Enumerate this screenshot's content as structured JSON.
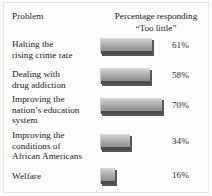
{
  "figure": {
    "background_color": "#fdfdfc",
    "bar_color_light": "#d5d3d1",
    "bar_color_dark": "#6f6d6b",
    "shadow_color": "#4e4c4a"
  },
  "header": {
    "problem_label": "Problem",
    "percentage_label_line1": "Percentage responding",
    "percentage_label_line2": "“Too little”"
  },
  "chart_data": {
    "type": "bar",
    "title": "",
    "subtitle": "",
    "xlabel": "Percentage responding “Too little”",
    "ylabel": "Problem",
    "orientation": "horizontal",
    "grid": false,
    "legend": "none",
    "xlim": [
      0,
      100
    ],
    "categories": [
      "Halting the rising crime rate",
      "Dealing with drug addiction",
      "Improving the nation’s education system",
      "Improving the conditions of African Americans",
      "Welfare"
    ],
    "values": [
      61,
      58,
      70,
      34,
      16
    ],
    "value_labels": [
      "61%",
      "58%",
      "70%",
      "34%",
      "16%"
    ]
  },
  "rows": [
    {
      "label_lines": [
        "Halting the",
        "rising crime rate"
      ],
      "value": 61,
      "value_label": "61%",
      "bar_px": 52,
      "top_px": 0,
      "label_top_px": 1,
      "height_px": 30
    },
    {
      "label_lines": [
        "Dealing with",
        "drug addiction"
      ],
      "value": 58,
      "value_label": "58%",
      "bar_px": 50,
      "top_px": 30,
      "label_top_px": 31,
      "height_px": 30
    },
    {
      "label_lines": [
        "Improving the",
        "nation’s education",
        "system"
      ],
      "value": 70,
      "value_label": "70%",
      "bar_px": 62,
      "top_px": 60,
      "label_top_px": 56,
      "height_px": 36
    },
    {
      "label_lines": [
        "Improving the",
        "conditions of",
        "African Americans"
      ],
      "value": 34,
      "value_label": "34%",
      "bar_px": 30,
      "top_px": 96,
      "label_top_px": 92,
      "height_px": 34
    },
    {
      "label_lines": [
        "Welfare"
      ],
      "value": 16,
      "value_label": "16%",
      "bar_px": 15,
      "top_px": 130,
      "label_top_px": 133,
      "height_px": 28
    }
  ]
}
